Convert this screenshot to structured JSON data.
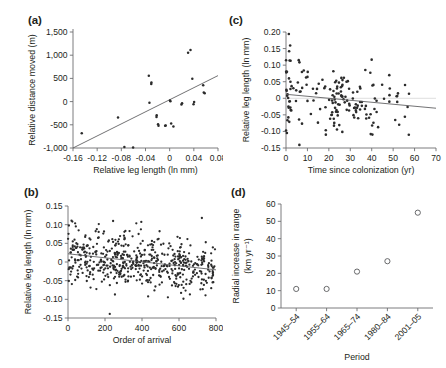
{
  "figure": {
    "background": "#ffffff",
    "point_color": "#2b2b2b",
    "line_color": "#58595b",
    "axis_color": "#6d6e71"
  },
  "panels": {
    "a": {
      "letter": "(a)",
      "chart_data": {
        "type": "scatter",
        "title": "",
        "xlabel": "Relative leg length (ln mm)",
        "ylabel": "Relative distance moved (m)",
        "xlim": [
          -0.16,
          0.08
        ],
        "ylim": [
          -1000,
          1500
        ],
        "xticks": [
          -0.16,
          -0.12,
          -0.08,
          -0.04,
          0,
          0.04,
          0.08
        ],
        "xticklabels": [
          "-0.16",
          "-0.12",
          "-0.08",
          "-0.04",
          "0",
          "0.04",
          "0.08"
        ],
        "yticks": [
          -1000,
          -500,
          0,
          500,
          1000,
          1500
        ],
        "yticklabels": [
          "-1,000",
          "-500",
          "0",
          "500",
          "1,000",
          "1,500"
        ],
        "grid": false,
        "legend": "none",
        "points": [
          [
            -0.1455,
            -680
          ],
          [
            -0.0855,
            -345
          ],
          [
            -0.075,
            -980
          ],
          [
            -0.0605,
            -990
          ],
          [
            -0.0345,
            555
          ],
          [
            -0.0305,
            380
          ],
          [
            -0.0302,
            410
          ],
          [
            -0.0335,
            -25
          ],
          [
            -0.0215,
            -295
          ],
          [
            -0.0218,
            -330
          ],
          [
            -0.0192,
            -490
          ],
          [
            -0.0185,
            -520
          ],
          [
            -0.0075,
            -520
          ],
          [
            -0.0065,
            -515
          ],
          [
            0.0005,
            25
          ],
          [
            0.0012,
            10
          ],
          [
            0.0025,
            -470
          ],
          [
            0.0062,
            -535
          ],
          [
            0.0195,
            -60
          ],
          [
            0.0205,
            -35
          ],
          [
            0.0305,
            1055
          ],
          [
            0.0345,
            1110
          ],
          [
            0.0375,
            495
          ],
          [
            0.0395,
            -55
          ],
          [
            0.0405,
            -10
          ],
          [
            0.0555,
            355
          ],
          [
            0.0565,
            195
          ],
          [
            0.058,
            180
          ]
        ],
        "fit_line": {
          "x": [
            -0.16,
            0.08
          ],
          "y": [
            -1000,
            560
          ]
        }
      }
    },
    "b": {
      "letter": "(b)",
      "chart_data": {
        "type": "scatter",
        "title": "",
        "xlabel": "Order of arrival",
        "ylabel": "Relative leg length (ln mm)",
        "xlim": [
          0,
          800
        ],
        "ylim": [
          -0.15,
          0.15
        ],
        "xticks": [
          0,
          200,
          400,
          600,
          800
        ],
        "xticklabels": [
          "0",
          "200",
          "400",
          "600",
          "800"
        ],
        "yticks": [
          -0.15,
          -0.1,
          -0.05,
          0,
          0.05,
          0.1,
          0.15
        ],
        "yticklabels": [
          "-0.15",
          "-0.10",
          "-0.05",
          "0",
          "0.05",
          "0.10",
          "0.15"
        ],
        "grid": false,
        "legend": "none",
        "n_points": 560,
        "description": "Dense scatter of relative leg length versus order of arrival; slight negative trend.",
        "fit_line": {
          "x": [
            0,
            800
          ],
          "y": [
            0.022,
            -0.021
          ]
        },
        "scatter_sd": 0.038
      }
    },
    "c": {
      "letter": "(c)",
      "chart_data": {
        "type": "scatter",
        "title": "",
        "xlabel": "Time since colonization (yr)",
        "ylabel": "Relative leg length (ln mm)",
        "xlim": [
          0,
          70
        ],
        "ylim": [
          -0.15,
          0.2
        ],
        "xticks": [
          0,
          10,
          20,
          30,
          40,
          50,
          60,
          70
        ],
        "xticklabels": [
          "0",
          "10",
          "20",
          "30",
          "40",
          "50",
          "60",
          "70"
        ],
        "yticks": [
          -0.15,
          -0.1,
          -0.05,
          0,
          0.05,
          0.1,
          0.15,
          0.2
        ],
        "yticklabels": [
          "-0.15",
          "-0.10",
          "-0.05",
          "0",
          "0.05",
          "0.10",
          "0.15",
          "0.20"
        ],
        "grid": false,
        "legend": "none",
        "n_points": 175,
        "description": "Scatter of relative leg length versus time since colonization; shallow negative fit line.",
        "fit_line": {
          "x": [
            0,
            70
          ],
          "y": [
            0.012,
            -0.03
          ]
        },
        "zero_reference": 0,
        "scatter_sd": 0.05
      }
    },
    "d": {
      "letter": "(d)",
      "chart_data": {
        "type": "scatter",
        "title": "",
        "xlabel": "Period",
        "ylabel": "Radial increase in range (km yr⁻¹)",
        "ylabel_line1": "Radial increase in range",
        "ylabel_line2": "(km yr⁻¹)",
        "ylim": [
          0,
          60
        ],
        "yticks": [
          0,
          10,
          20,
          30,
          40,
          50,
          60
        ],
        "yticklabels": [
          "0",
          "10",
          "20",
          "30",
          "40",
          "50",
          "60"
        ],
        "categories": [
          "1945–54",
          "1955–64",
          "1965–74",
          "1980–84",
          "2001–05"
        ],
        "values": [
          11,
          11,
          21,
          27,
          55
        ],
        "grid": false,
        "legend": "none",
        "marker": "open-circle"
      }
    }
  }
}
